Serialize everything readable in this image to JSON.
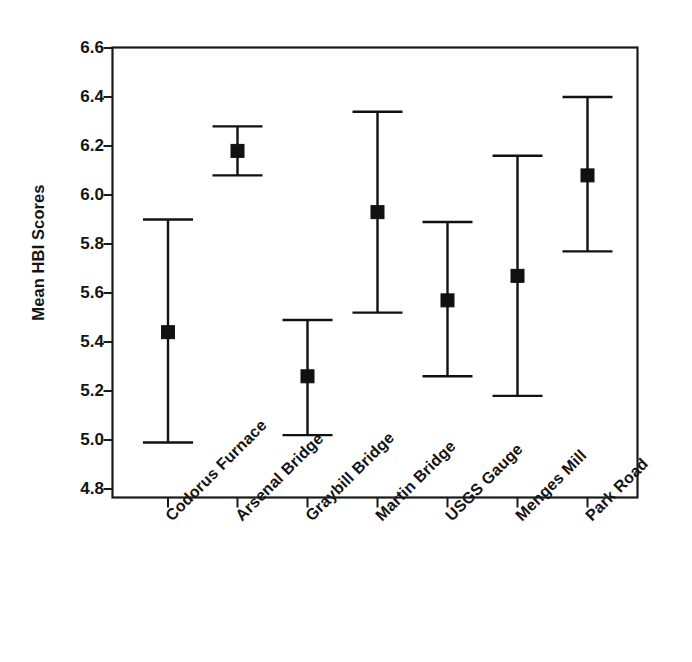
{
  "chart_data": {
    "type": "scatter",
    "title": "",
    "xlabel": "",
    "ylabel": "Mean HBI Scores",
    "ylim": [
      4.8,
      6.6
    ],
    "ytick_labels": [
      "6.6",
      "6.4",
      "6.2",
      "6.0",
      "5.8",
      "5.6",
      "5.4",
      "5.2",
      "5.0",
      "4.8"
    ],
    "yticks": [
      6.6,
      6.4,
      6.2,
      6.0,
      5.8,
      5.6,
      5.4,
      5.2,
      5.0,
      4.8
    ],
    "grid": false,
    "legend": "none",
    "marker": "filled-square",
    "error_bars": "capped-vertical",
    "categories": [
      "Codorus Furnace",
      "Arsenal Bridge",
      "Graybill Bridge",
      "Martin Bridge",
      "USGS Gauge",
      "Menges Mill",
      "Park Road"
    ],
    "values": [
      5.44,
      6.18,
      5.26,
      5.93,
      5.57,
      5.67,
      6.08
    ],
    "lower": [
      4.99,
      6.08,
      5.02,
      5.52,
      5.26,
      5.18,
      5.77
    ],
    "upper": [
      5.9,
      6.28,
      5.49,
      6.34,
      5.89,
      6.16,
      6.4
    ],
    "series": [
      {
        "name": "Mean HBI Scores",
        "points": [
          {
            "category": "Codorus Furnace",
            "mean": 5.44,
            "lower": 4.99,
            "upper": 5.9
          },
          {
            "category": "Arsenal Bridge",
            "mean": 6.18,
            "lower": 6.08,
            "upper": 6.28
          },
          {
            "category": "Graybill Bridge",
            "mean": 5.26,
            "lower": 5.02,
            "upper": 5.49
          },
          {
            "category": "Martin Bridge",
            "mean": 5.93,
            "lower": 5.52,
            "upper": 6.34
          },
          {
            "category": "USGS Gauge",
            "mean": 5.57,
            "lower": 5.26,
            "upper": 5.89
          },
          {
            "category": "Menges Mill",
            "mean": 5.67,
            "lower": 5.18,
            "upper": 6.16
          },
          {
            "category": "Park Road",
            "mean": 6.08,
            "lower": 5.77,
            "upper": 6.4
          }
        ]
      }
    ],
    "colors": {
      "marker": "#111111",
      "error_bar": "#111111",
      "axis": "#1a1a1a",
      "background": "#ffffff",
      "text": "#141414"
    }
  }
}
